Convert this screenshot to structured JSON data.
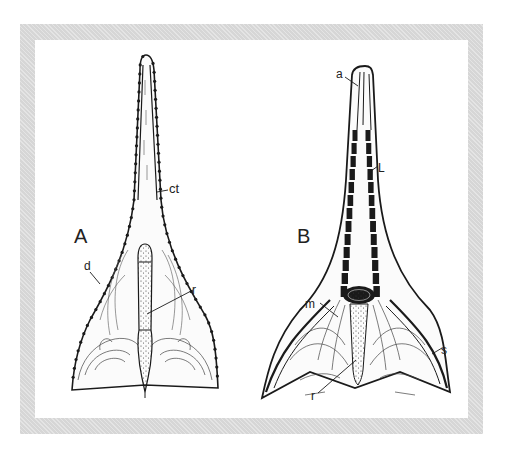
{
  "figure": {
    "panels": [
      {
        "id": "A",
        "label": "A",
        "annotations": [
          {
            "key": "ct",
            "text": "ct"
          },
          {
            "key": "d",
            "text": "d"
          },
          {
            "key": "r",
            "text": "r"
          }
        ]
      },
      {
        "id": "B",
        "label": "B",
        "annotations": [
          {
            "key": "a",
            "text": "a"
          },
          {
            "key": "l",
            "text": "L"
          },
          {
            "key": "m",
            "text": "m"
          },
          {
            "key": "s",
            "text": "s"
          },
          {
            "key": "r",
            "text": "r"
          }
        ]
      }
    ],
    "colors": {
      "frame": "#d6d6d6",
      "ink": "#1a1a1a",
      "background": "#ffffff"
    }
  }
}
